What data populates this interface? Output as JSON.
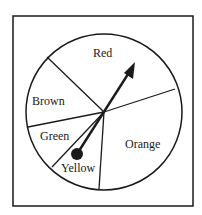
{
  "diagram": {
    "type": "spinner",
    "frame": {
      "x": 13,
      "y": 16,
      "width": 180,
      "height": 190
    },
    "circle": {
      "cx": 104,
      "cy": 112,
      "r": 78
    },
    "colors": {
      "stroke": "#1a1a1a",
      "background": "#ffffff"
    },
    "sectors": [
      {
        "label": "Red",
        "label_x": 93,
        "label_y": 57
      },
      {
        "label": "Brown",
        "label_x": 32,
        "label_y": 105
      },
      {
        "label": "Green",
        "label_x": 40,
        "label_y": 140
      },
      {
        "label": "Yellow",
        "label_x": 61,
        "label_y": 172
      },
      {
        "label": "Orange",
        "label_x": 125,
        "label_y": 148
      }
    ],
    "dividers": [
      {
        "between": [
          "Red",
          "Brown"
        ],
        "x2": 47,
        "y2": 57
      },
      {
        "between": [
          "Red",
          "Orange"
        ],
        "x2": 175,
        "y2": 89
      },
      {
        "between": [
          "Brown",
          "Green"
        ],
        "x2": 28,
        "y2": 127
      },
      {
        "between": [
          "Green",
          "Yellow"
        ],
        "x2": 52,
        "y2": 167
      },
      {
        "between": [
          "Yellow",
          "Orange"
        ],
        "x2": 99,
        "y2": 189
      }
    ],
    "pointer": {
      "tail_x": 77,
      "tail_y": 154,
      "tip_x": 135,
      "tip_y": 62,
      "ball_r": 6
    }
  }
}
